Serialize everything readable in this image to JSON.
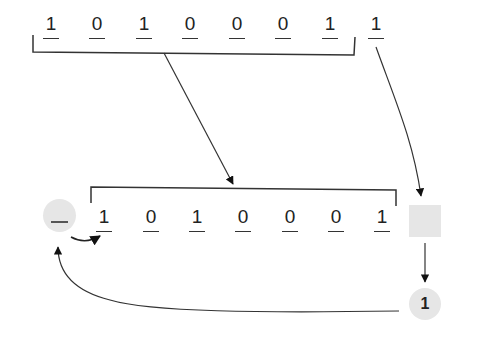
{
  "diagram": {
    "top_register": {
      "bits": [
        "1",
        "0",
        "1",
        "0",
        "0",
        "0",
        "1",
        "1"
      ],
      "bracketed_count": 7
    },
    "bottom_register": {
      "bits": [
        "1",
        "0",
        "1",
        "0",
        "0",
        "0",
        "1"
      ]
    },
    "carry_in_circle": {
      "label": "_"
    },
    "shifted_out_box": {
      "label": ""
    },
    "output_circle": {
      "label": "1"
    },
    "colors": {
      "line": "#333333",
      "fill_gray": "#e6e6e6",
      "text": "#222222",
      "background": "#ffffff"
    }
  }
}
